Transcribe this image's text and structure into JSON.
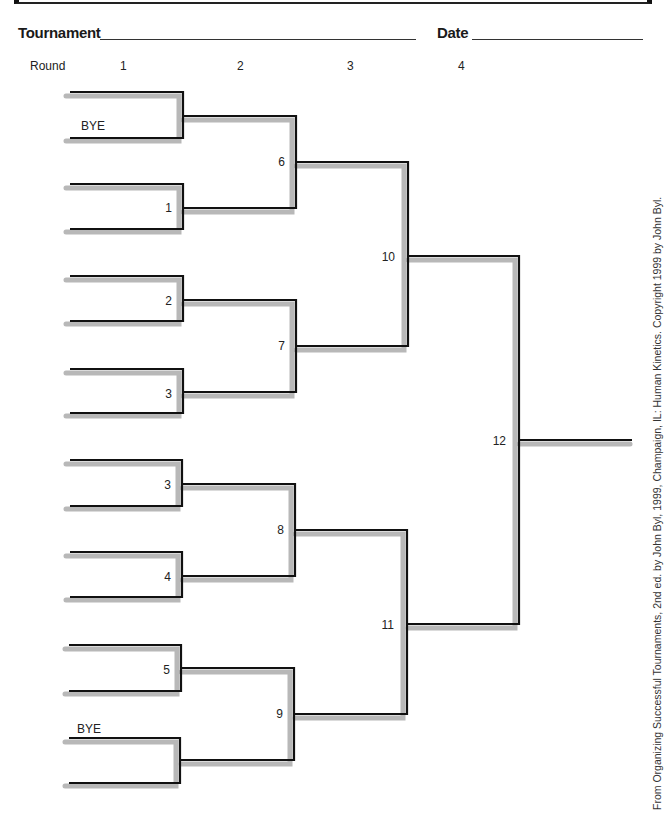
{
  "header": {
    "tournament_label": "Tournament",
    "tournament_value": "",
    "date_label": "Date",
    "date_value": ""
  },
  "rounds": {
    "label": "Round",
    "numbers": [
      "1",
      "2",
      "3",
      "4"
    ]
  },
  "bracket": {
    "round1_slots": [
      {
        "label": "",
        "game": ""
      },
      {
        "label": "BYE",
        "game": ""
      },
      {
        "label": "",
        "game": "1"
      },
      {
        "label": "",
        "game": ""
      },
      {
        "label": "",
        "game": "2"
      },
      {
        "label": "",
        "game": ""
      },
      {
        "label": "",
        "game": "3"
      },
      {
        "label": "",
        "game": ""
      },
      {
        "label": "",
        "game": "3"
      },
      {
        "label": "",
        "game": ""
      },
      {
        "label": "",
        "game": "4"
      },
      {
        "label": "",
        "game": ""
      },
      {
        "label": "",
        "game": "5"
      },
      {
        "label": "",
        "game": ""
      },
      {
        "label": "BYE",
        "game": ""
      },
      {
        "label": "",
        "game": ""
      }
    ],
    "round1_games": [
      "",
      "1",
      "2",
      "3",
      "3",
      "4",
      "5",
      ""
    ],
    "round2_games": [
      "6",
      "7",
      "8",
      "9"
    ],
    "round3_games": [
      "10",
      "11"
    ],
    "round4_games": [
      "12"
    ],
    "bye_labels": [
      "BYE",
      "BYE"
    ]
  },
  "credit": "From Organizing Successful Tournaments, 2nd ed. by John Byl, 1999, Champaign, IL: Human Kinetics. Copyright 1999 by John Byl.",
  "colors": {
    "line": "#111111",
    "shadow": "#b8b8b8"
  }
}
